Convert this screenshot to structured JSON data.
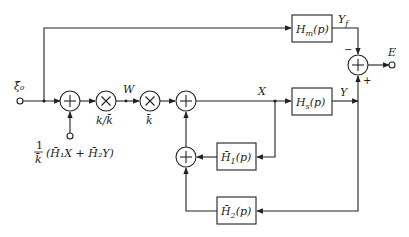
{
  "diagram": {
    "type": "block-diagram",
    "input": {
      "label": "ξ̂₀"
    },
    "output": {
      "label": "E"
    },
    "signals": {
      "w": "W",
      "x": "X",
      "y": "Y",
      "yf": "Y_f"
    },
    "blocks": {
      "hm": {
        "label": "Hm(p)",
        "main": "H",
        "sub": "m",
        "tail": "(p)"
      },
      "hs": {
        "label": "Hs(p)",
        "main": "H",
        "sub": "s",
        "tail": "(p)"
      },
      "h1": {
        "label": "H̄1(p)",
        "main": "H̄",
        "sub": "1",
        "tail": "(p)"
      },
      "h2": {
        "label": "H̄2(p)",
        "main": "H̄",
        "sub": "2",
        "tail": "(p)"
      }
    },
    "operators": {
      "sum1": {
        "symbol": "+"
      },
      "mult1": {
        "symbol": "×",
        "gain": "k/k̄"
      },
      "mult2": {
        "symbol": "×",
        "gain": "k̄"
      },
      "sum2": {
        "symbol": "+"
      },
      "sum3": {
        "symbol": "+"
      },
      "sum_out": {
        "symbol": "+",
        "minus": "−",
        "plus": "+"
      }
    },
    "side_input": {
      "frac_num": "1",
      "frac_den": "k̄",
      "expr": "(H̄₁X + H̄₂Y)"
    },
    "yf_main": "Y",
    "yf_sub": "f"
  }
}
